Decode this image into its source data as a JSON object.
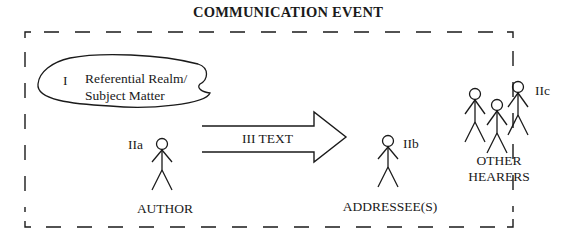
{
  "title": "COMMUNICATION EVENT",
  "referential_realm": {
    "number": "I",
    "line1": "Referential Realm/",
    "line2": "Subject Matter"
  },
  "text_arrow": {
    "label": "III TEXT"
  },
  "author": {
    "code": "IIa",
    "label": "AUTHOR"
  },
  "addressee": {
    "code": "IIb",
    "label": "ADDRESSEE(S)"
  },
  "other_hearers": {
    "code": "IIc",
    "line1": "OTHER",
    "line2": "HEARERS"
  },
  "colors": {
    "stroke": "#1a1a1a",
    "background": "#ffffff"
  }
}
